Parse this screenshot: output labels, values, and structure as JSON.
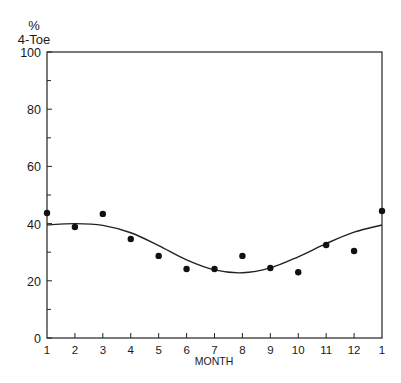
{
  "chart_data": {
    "type": "scatter",
    "title": "",
    "ylabel_line1": "%",
    "ylabel_line2": "4-Toe",
    "xlabel": "MONTH",
    "ylim": [
      0,
      100
    ],
    "yticks": [
      0,
      20,
      40,
      60,
      80,
      100
    ],
    "yticks_minor": [
      10,
      30,
      50,
      70,
      90
    ],
    "categories": [
      "1",
      "2",
      "3",
      "4",
      "5",
      "6",
      "7",
      "8",
      "9",
      "10",
      "11",
      "12",
      "1"
    ],
    "grid": false,
    "legend": null,
    "series": [
      {
        "name": "observed",
        "kind": "points",
        "values": [
          43.7,
          38.8,
          43.4,
          34.6,
          28.7,
          24.1,
          24.1,
          28.7,
          24.5,
          23.0,
          32.5,
          30.4,
          44.4
        ]
      },
      {
        "name": "fitted curve",
        "kind": "line",
        "values": [
          39.5,
          40.0,
          39.4,
          36.8,
          32.3,
          27.3,
          23.8,
          22.8,
          24.5,
          28.4,
          33.0,
          37.0,
          39.5
        ]
      }
    ]
  }
}
